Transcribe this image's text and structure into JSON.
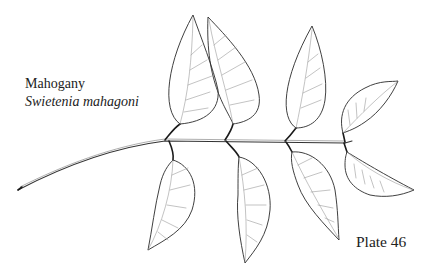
{
  "plate": {
    "common_name": "Mahogany",
    "scientific_name": "Swietenia mahagoni",
    "plate_label": "Plate 46"
  },
  "illustration": {
    "subject": "pinnately-compound-leaf-branch",
    "style": "botanical-line-drawing",
    "leaflet_count": 8,
    "stroke_color": "#2a2a2a",
    "vein_color": "#9a9a9a",
    "background": "#ffffff"
  }
}
